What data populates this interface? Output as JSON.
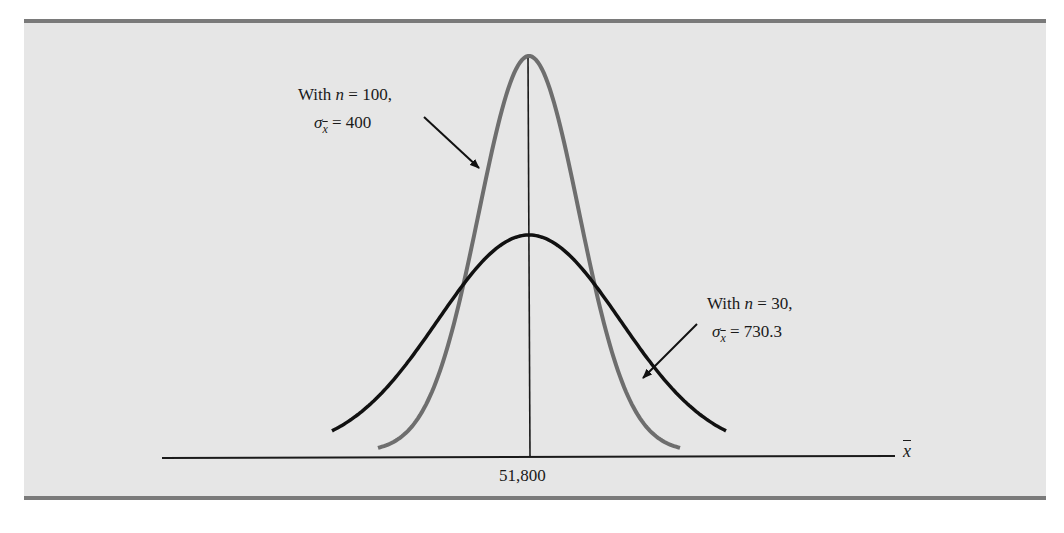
{
  "chart_data": {
    "type": "line",
    "title": "",
    "xlabel": "x̄",
    "ylabel": "",
    "x_tick_labels": [
      "51,800"
    ],
    "mean": 51800,
    "grid": false,
    "series": [
      {
        "name": "With n = 100, σx̄ = 400",
        "n": 100,
        "std_error": 400,
        "color": "#6e6e6e",
        "distribution": "normal",
        "relative_peak_height": 1.0
      },
      {
        "name": "With n = 30, σx̄ = 730.3",
        "n": 30,
        "std_error": 730.3,
        "color": "#111111",
        "distribution": "normal",
        "relative_peak_height": 0.548
      }
    ],
    "annotations": [
      {
        "text_line1": "With n = 100,",
        "text_line2": "σx̄ = 400",
        "points_to": "n=100 curve (gray)"
      },
      {
        "text_line1": "With n = 30,",
        "text_line2": "σx̄ = 730.3",
        "points_to": "n=30 curve (black)"
      }
    ],
    "legend": "none (inline annotations with arrows)"
  },
  "labels": {
    "n100": {
      "prefix": "With ",
      "var": "n",
      "eq": " = 100,",
      "sigma": "σ",
      "sub": "x",
      "value": " = 400"
    },
    "n30": {
      "prefix": "With ",
      "var": "n",
      "eq": " = 30,",
      "sigma": "σ",
      "sub": "x",
      "value": " = 730.3"
    },
    "tick_center": "51,800",
    "axis_symbol": "x"
  },
  "colors": {
    "panel_bg": "#e6e6e6",
    "rule": "#7a7a7a",
    "curve_n100": "#6e6e6e",
    "curve_n30": "#111111",
    "axis": "#1a1a1a"
  }
}
